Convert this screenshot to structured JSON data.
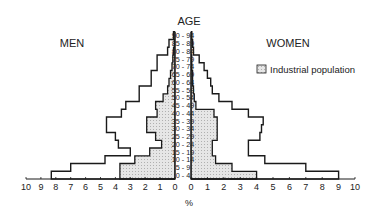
{
  "chart_data": {
    "type": "bar",
    "subtype": "population-pyramid",
    "title": "",
    "age_axis_label": "AGE",
    "x_axis_label": "%",
    "left_label": "MEN",
    "right_label": "WOMEN",
    "legend": [
      {
        "label": "Industrial population",
        "style": "dotted-grey-fill"
      }
    ],
    "legend_position": "upper-right",
    "xlim": [
      0,
      10
    ],
    "x_ticks": [
      0,
      1,
      2,
      3,
      4,
      5,
      6,
      7,
      8,
      9,
      10
    ],
    "categories": [
      "0 - 4",
      "5 - 9",
      "10 - 14",
      "15 - 19",
      "20 - 24",
      "25 - 29",
      "30 - 34",
      "35 - 39",
      "40 - 44",
      "45 - 49",
      "50 - 54",
      "55 - 59",
      "60 - 64",
      "65 - 69",
      "70 - 74",
      "75 - 79",
      "80 - 84",
      "85 - 89",
      "90 - 94"
    ],
    "series": [
      {
        "name": "Men (total)",
        "side": "left",
        "fill": "none",
        "values": [
          8.3,
          7.0,
          4.7,
          3.0,
          3.8,
          4.0,
          4.6,
          4.6,
          3.6,
          3.3,
          2.4,
          2.4,
          1.6,
          1.6,
          1.2,
          1.2,
          0.5,
          0.4,
          0.1
        ]
      },
      {
        "name": "Men (industrial population)",
        "side": "left",
        "fill": "dotted",
        "values": [
          3.7,
          3.7,
          2.7,
          1.7,
          0.9,
          1.3,
          1.9,
          1.9,
          1.2,
          1.3,
          0.8,
          0.5,
          0.4,
          0.3,
          0.2,
          0.15,
          0.1,
          0.05,
          0.0
        ]
      },
      {
        "name": "Women (total)",
        "side": "right",
        "fill": "none",
        "values": [
          9.0,
          7.0,
          4.5,
          3.5,
          3.5,
          4.2,
          4.3,
          4.4,
          3.5,
          2.5,
          1.7,
          1.3,
          1.2,
          1.0,
          0.8,
          0.5,
          0.15,
          0.1,
          0.05
        ]
      },
      {
        "name": "Women (industrial population)",
        "side": "right",
        "fill": "dotted",
        "values": [
          4.0,
          2.5,
          1.5,
          1.3,
          1.3,
          1.6,
          1.6,
          1.6,
          1.4,
          0.3,
          0.2,
          0.15,
          0.1,
          0.1,
          0.05,
          0.05,
          0.0,
          0.0,
          0.0
        ]
      }
    ]
  },
  "colors": {
    "line": "#1a1a1a",
    "industrial_fill": "#e2e2e2",
    "background": "#ffffff"
  }
}
